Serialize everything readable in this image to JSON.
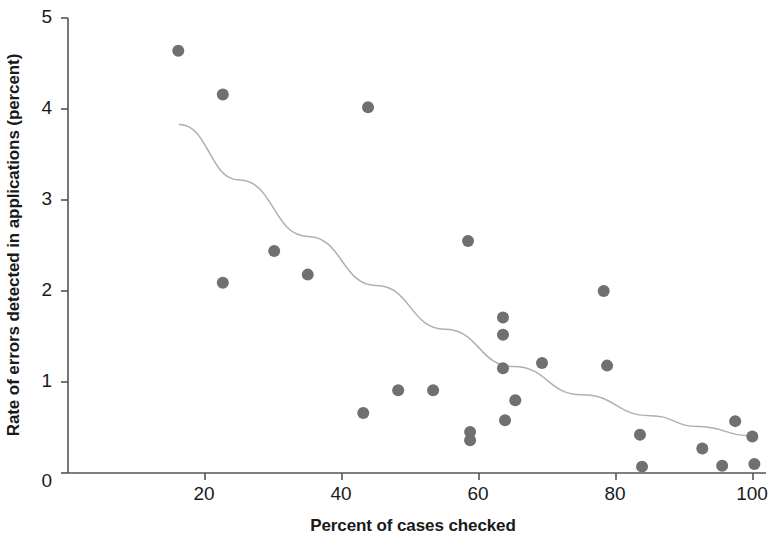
{
  "chart_data": {
    "type": "scatter",
    "title": "",
    "xlabel": "Percent of cases checked",
    "ylabel": "Rate of errors detected in applications (percent)",
    "xlim": [
      0,
      103
    ],
    "ylim": [
      0,
      5
    ],
    "xticks": [
      20,
      40,
      60,
      80,
      100
    ],
    "xtick_labels": [
      "20",
      "40",
      "60",
      "80",
      "100"
    ],
    "yticks": [
      0,
      1,
      2,
      3,
      4,
      5
    ],
    "ytick_labels": [
      "0",
      "1",
      "2",
      "3",
      "4",
      "5"
    ],
    "grid": false,
    "legend": "none",
    "marker_color": "#707070",
    "trendline_color": "#b0b0b0",
    "axis_color": "#555555",
    "points": [
      {
        "x": 16.1,
        "y": 4.64
      },
      {
        "x": 22.6,
        "y": 4.16
      },
      {
        "x": 22.6,
        "y": 2.09
      },
      {
        "x": 30.1,
        "y": 2.44
      },
      {
        "x": 35.0,
        "y": 2.18
      },
      {
        "x": 43.1,
        "y": 0.66
      },
      {
        "x": 43.8,
        "y": 4.02
      },
      {
        "x": 48.2,
        "y": 0.91
      },
      {
        "x": 53.3,
        "y": 0.91
      },
      {
        "x": 58.4,
        "y": 2.55
      },
      {
        "x": 58.7,
        "y": 0.45
      },
      {
        "x": 58.7,
        "y": 0.36
      },
      {
        "x": 63.5,
        "y": 1.71
      },
      {
        "x": 63.5,
        "y": 1.52
      },
      {
        "x": 63.5,
        "y": 1.15
      },
      {
        "x": 63.8,
        "y": 0.58
      },
      {
        "x": 65.3,
        "y": 0.8
      },
      {
        "x": 69.2,
        "y": 1.21
      },
      {
        "x": 78.2,
        "y": 2.0
      },
      {
        "x": 78.7,
        "y": 1.18
      },
      {
        "x": 83.5,
        "y": 0.42
      },
      {
        "x": 83.8,
        "y": 0.07
      },
      {
        "x": 92.6,
        "y": 0.27
      },
      {
        "x": 95.5,
        "y": 0.08
      },
      {
        "x": 97.4,
        "y": 0.57
      },
      {
        "x": 99.9,
        "y": 0.4
      },
      {
        "x": 100.2,
        "y": 0.1
      }
    ],
    "trendline": [
      {
        "x": 16.2,
        "y": 3.83
      },
      {
        "x": 25.0,
        "y": 3.22
      },
      {
        "x": 35.0,
        "y": 2.6
      },
      {
        "x": 45.0,
        "y": 2.06
      },
      {
        "x": 55.0,
        "y": 1.58
      },
      {
        "x": 65.0,
        "y": 1.17
      },
      {
        "x": 75.0,
        "y": 0.86
      },
      {
        "x": 85.0,
        "y": 0.63
      },
      {
        "x": 92.0,
        "y": 0.51
      },
      {
        "x": 99.7,
        "y": 0.41
      }
    ]
  }
}
